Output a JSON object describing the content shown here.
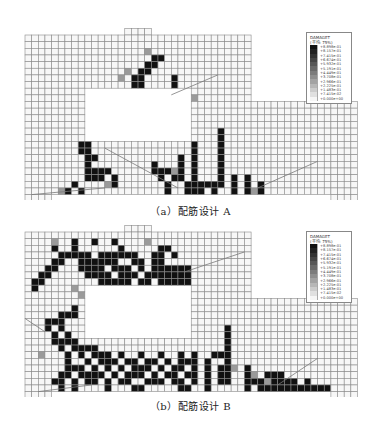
{
  "figure": {
    "cell_size": 6.65,
    "mesh_color": "#8a8a8a",
    "fill_color": "#f7f7f7",
    "damage_color": "#111111",
    "geometry": {
      "upper_cols": 34,
      "total_cols": 50,
      "upper_rows": 10,
      "total_rows": 24,
      "opening": {
        "col0": 9,
        "col1": 25,
        "row0": 8,
        "row1": 16
      },
      "top_stub": {
        "col0": 15,
        "col1": 19
      },
      "bottom_left_stub": {
        "col0": 0,
        "col1": 4
      },
      "bottom_right_stub": {
        "col0": 46,
        "col1": 50
      }
    }
  },
  "legend": {
    "title": "DAMAGET",
    "subtitle": "(平均: 75%)",
    "entries": [
      {
        "value": "+8.898e-01",
        "color": "#111111"
      },
      {
        "value": "+8.157e-01",
        "color": "#222222"
      },
      {
        "value": "+7.415e-01",
        "color": "#333333"
      },
      {
        "value": "+6.674e-01",
        "color": "#454545"
      },
      {
        "value": "+5.932e-01",
        "color": "#575757"
      },
      {
        "value": "+5.191e-01",
        "color": "#6a6a6a"
      },
      {
        "value": "+4.449e-01",
        "color": "#7c7c7c"
      },
      {
        "value": "+3.708e-01",
        "color": "#8f8f8f"
      },
      {
        "value": "+2.966e-01",
        "color": "#a3a3a3"
      },
      {
        "value": "+2.225e-01",
        "color": "#b7b7b7"
      },
      {
        "value": "+1.483e-01",
        "color": "#cccccc"
      },
      {
        "value": "+7.415e-02",
        "color": "#e0e0e0"
      },
      {
        "value": "+0.000e+00",
        "color": "#f6f6f6"
      }
    ]
  },
  "panels": [
    {
      "id": "A",
      "caption": "（a）配筋设计 A",
      "damage": [
        [
          19,
          3
        ],
        [
          20,
          3
        ],
        [
          18,
          4
        ],
        [
          19,
          4
        ],
        [
          17,
          5
        ],
        [
          18,
          5
        ],
        [
          16,
          6
        ],
        [
          17,
          6
        ],
        [
          16,
          7
        ],
        [
          17,
          7
        ],
        [
          22,
          6
        ],
        [
          22,
          7
        ],
        [
          19,
          8
        ],
        [
          21,
          8
        ],
        [
          22,
          8
        ],
        [
          23,
          8
        ],
        [
          24,
          8
        ],
        [
          20,
          9
        ],
        [
          22,
          9
        ],
        [
          24,
          9
        ],
        [
          8,
          16
        ],
        [
          9,
          16
        ],
        [
          8,
          17
        ],
        [
          9,
          17
        ],
        [
          9,
          18
        ],
        [
          10,
          18
        ],
        [
          9,
          19
        ],
        [
          9,
          20
        ],
        [
          10,
          20
        ],
        [
          11,
          20
        ],
        [
          12,
          20
        ],
        [
          9,
          21
        ],
        [
          10,
          21
        ],
        [
          11,
          21
        ],
        [
          13,
          21
        ],
        [
          13,
          22
        ],
        [
          7,
          22
        ],
        [
          6,
          23
        ],
        [
          8,
          23
        ],
        [
          19,
          19
        ],
        [
          19,
          20
        ],
        [
          20,
          20
        ],
        [
          21,
          20
        ],
        [
          20,
          21
        ],
        [
          22,
          21
        ],
        [
          23,
          21
        ],
        [
          21,
          22
        ],
        [
          24,
          22
        ],
        [
          21,
          23
        ],
        [
          24,
          23
        ],
        [
          23,
          18
        ],
        [
          23,
          19
        ],
        [
          23,
          20
        ],
        [
          25,
          16
        ],
        [
          25,
          17
        ],
        [
          25,
          18
        ],
        [
          25,
          19
        ],
        [
          25,
          20
        ],
        [
          25,
          21
        ],
        [
          25,
          22
        ],
        [
          26,
          22
        ],
        [
          26,
          23
        ],
        [
          25,
          23
        ],
        [
          27,
          22
        ],
        [
          29,
          14
        ],
        [
          29,
          15
        ],
        [
          29,
          16
        ],
        [
          29,
          17
        ],
        [
          29,
          18
        ],
        [
          29,
          19
        ],
        [
          29,
          20
        ],
        [
          29,
          21
        ],
        [
          29,
          22
        ],
        [
          28,
          22
        ],
        [
          28,
          23
        ],
        [
          31,
          21
        ],
        [
          31,
          22
        ],
        [
          31,
          23
        ],
        [
          33,
          21
        ],
        [
          33,
          22
        ],
        [
          33,
          23
        ],
        [
          35,
          22
        ],
        [
          35,
          23
        ]
      ],
      "halos": [
        [
          14,
          6
        ],
        [
          15,
          5
        ],
        [
          18,
          2
        ],
        [
          19,
          9
        ],
        [
          25,
          9
        ],
        [
          12,
          22
        ],
        [
          5,
          23
        ],
        [
          22,
          20
        ],
        [
          34,
          23
        ]
      ],
      "lines": [
        [
          [
            12,
            17
          ],
          [
            23,
            23
          ]
        ],
        [
          [
            35,
            23
          ],
          [
            44,
            19
          ]
        ],
        [
          [
            22,
            9
          ],
          [
            29,
            6
          ]
        ],
        [
          [
            1,
            24
          ],
          [
            12,
            23
          ]
        ]
      ]
    },
    {
      "id": "B",
      "caption": "（b）配筋设计 B",
      "damage": [
        [
          4,
          2
        ],
        [
          7,
          1
        ],
        [
          7,
          2
        ],
        [
          10,
          1
        ],
        [
          13,
          1
        ],
        [
          14,
          2
        ],
        [
          20,
          2
        ],
        [
          21,
          2
        ],
        [
          20,
          3
        ],
        [
          22,
          3
        ],
        [
          5,
          3
        ],
        [
          6,
          3
        ],
        [
          7,
          3
        ],
        [
          8,
          3
        ],
        [
          9,
          3
        ],
        [
          11,
          3
        ],
        [
          12,
          3
        ],
        [
          13,
          3
        ],
        [
          14,
          3
        ],
        [
          15,
          3
        ],
        [
          16,
          3
        ],
        [
          19,
          3
        ],
        [
          4,
          4
        ],
        [
          5,
          4
        ],
        [
          8,
          4
        ],
        [
          9,
          4
        ],
        [
          10,
          4
        ],
        [
          11,
          4
        ],
        [
          12,
          4
        ],
        [
          13,
          4
        ],
        [
          16,
          4
        ],
        [
          17,
          4
        ],
        [
          19,
          4
        ],
        [
          20,
          4
        ],
        [
          3,
          5
        ],
        [
          4,
          5
        ],
        [
          8,
          5
        ],
        [
          9,
          5
        ],
        [
          10,
          5
        ],
        [
          11,
          5
        ],
        [
          13,
          5
        ],
        [
          14,
          5
        ],
        [
          15,
          5
        ],
        [
          17,
          5
        ],
        [
          19,
          5
        ],
        [
          20,
          5
        ],
        [
          21,
          5
        ],
        [
          22,
          5
        ],
        [
          23,
          5
        ],
        [
          24,
          5
        ],
        [
          2,
          6
        ],
        [
          3,
          6
        ],
        [
          9,
          6
        ],
        [
          10,
          6
        ],
        [
          11,
          6
        ],
        [
          12,
          6
        ],
        [
          14,
          6
        ],
        [
          15,
          6
        ],
        [
          16,
          6
        ],
        [
          18,
          6
        ],
        [
          19,
          6
        ],
        [
          20,
          6
        ],
        [
          21,
          6
        ],
        [
          22,
          6
        ],
        [
          23,
          6
        ],
        [
          24,
          6
        ],
        [
          1,
          7
        ],
        [
          2,
          7
        ],
        [
          11,
          7
        ],
        [
          12,
          7
        ],
        [
          13,
          7
        ],
        [
          14,
          7
        ],
        [
          15,
          7
        ],
        [
          17,
          7
        ],
        [
          18,
          7
        ],
        [
          20,
          7
        ],
        [
          21,
          7
        ],
        [
          22,
          7
        ],
        [
          23,
          7
        ],
        [
          24,
          7
        ],
        [
          1,
          8
        ],
        [
          12,
          8
        ],
        [
          13,
          8
        ],
        [
          14,
          8
        ],
        [
          16,
          8
        ],
        [
          18,
          8
        ],
        [
          19,
          8
        ],
        [
          7,
          11
        ],
        [
          5,
          12
        ],
        [
          6,
          12
        ],
        [
          7,
          12
        ],
        [
          3,
          13
        ],
        [
          4,
          13
        ],
        [
          5,
          13
        ],
        [
          3,
          14
        ],
        [
          5,
          14
        ],
        [
          4,
          15
        ],
        [
          6,
          15
        ],
        [
          4,
          16
        ],
        [
          5,
          16
        ],
        [
          6,
          16
        ],
        [
          7,
          16
        ],
        [
          5,
          17
        ],
        [
          7,
          17
        ],
        [
          8,
          17
        ],
        [
          9,
          17
        ],
        [
          10,
          17
        ],
        [
          6,
          18
        ],
        [
          8,
          18
        ],
        [
          10,
          18
        ],
        [
          11,
          18
        ],
        [
          12,
          18
        ],
        [
          14,
          18
        ],
        [
          17,
          18
        ],
        [
          20,
          18
        ],
        [
          23,
          18
        ],
        [
          25,
          18
        ],
        [
          6,
          19
        ],
        [
          9,
          19
        ],
        [
          11,
          19
        ],
        [
          12,
          19
        ],
        [
          13,
          19
        ],
        [
          15,
          19
        ],
        [
          16,
          19
        ],
        [
          18,
          19
        ],
        [
          19,
          19
        ],
        [
          21,
          19
        ],
        [
          23,
          19
        ],
        [
          24,
          19
        ],
        [
          25,
          19
        ],
        [
          6,
          20
        ],
        [
          7,
          20
        ],
        [
          8,
          20
        ],
        [
          10,
          20
        ],
        [
          12,
          20
        ],
        [
          14,
          20
        ],
        [
          16,
          20
        ],
        [
          17,
          20
        ],
        [
          18,
          20
        ],
        [
          20,
          20
        ],
        [
          22,
          20
        ],
        [
          23,
          20
        ],
        [
          25,
          20
        ],
        [
          5,
          21
        ],
        [
          6,
          21
        ],
        [
          8,
          21
        ],
        [
          9,
          21
        ],
        [
          10,
          21
        ],
        [
          11,
          21
        ],
        [
          13,
          21
        ],
        [
          15,
          21
        ],
        [
          16,
          21
        ],
        [
          17,
          21
        ],
        [
          19,
          21
        ],
        [
          21,
          21
        ],
        [
          22,
          21
        ],
        [
          24,
          21
        ],
        [
          25,
          21
        ],
        [
          4,
          22
        ],
        [
          5,
          22
        ],
        [
          7,
          22
        ],
        [
          9,
          22
        ],
        [
          10,
          22
        ],
        [
          12,
          22
        ],
        [
          14,
          22
        ],
        [
          15,
          22
        ],
        [
          18,
          22
        ],
        [
          19,
          22
        ],
        [
          20,
          22
        ],
        [
          22,
          22
        ],
        [
          23,
          22
        ],
        [
          25,
          22
        ],
        [
          5,
          23
        ],
        [
          7,
          23
        ],
        [
          12,
          23
        ],
        [
          16,
          23
        ],
        [
          17,
          23
        ],
        [
          23,
          23
        ],
        [
          24,
          23
        ],
        [
          30,
          14
        ],
        [
          30,
          15
        ],
        [
          30,
          16
        ],
        [
          30,
          17
        ],
        [
          30,
          18
        ],
        [
          30,
          19
        ],
        [
          30,
          20
        ],
        [
          30,
          21
        ],
        [
          30,
          22
        ],
        [
          28,
          18
        ],
        [
          29,
          18
        ],
        [
          27,
          19
        ],
        [
          27,
          20
        ],
        [
          27,
          21
        ],
        [
          27,
          22
        ],
        [
          27,
          23
        ],
        [
          29,
          20
        ],
        [
          29,
          21
        ],
        [
          29,
          22
        ],
        [
          33,
          20
        ],
        [
          33,
          21
        ],
        [
          33,
          22
        ],
        [
          33,
          23
        ],
        [
          34,
          22
        ],
        [
          35,
          22
        ],
        [
          35,
          23
        ],
        [
          36,
          21
        ],
        [
          37,
          21
        ],
        [
          37,
          22
        ],
        [
          38,
          21
        ],
        [
          38,
          22
        ],
        [
          39,
          22
        ],
        [
          40,
          22
        ],
        [
          40,
          23
        ],
        [
          36,
          23
        ],
        [
          37,
          23
        ],
        [
          38,
          23
        ],
        [
          39,
          23
        ],
        [
          41,
          23
        ],
        [
          42,
          23
        ],
        [
          43,
          23
        ],
        [
          44,
          23
        ],
        [
          45,
          23
        ],
        [
          42,
          22
        ]
      ],
      "halos": [
        [
          4,
          1
        ],
        [
          18,
          1
        ],
        [
          21,
          6
        ],
        [
          22,
          7
        ],
        [
          7,
          8
        ],
        [
          8,
          9
        ],
        [
          3,
          14
        ],
        [
          2,
          18
        ],
        [
          12,
          19
        ],
        [
          14,
          20
        ],
        [
          24,
          14
        ],
        [
          31,
          20
        ],
        [
          34,
          21
        ],
        [
          36,
          22
        ]
      ],
      "lines": [
        [
          [
            24,
            6
          ],
          [
            33,
            3
          ]
        ],
        [
          [
            0,
            13
          ],
          [
            3,
            15
          ]
        ],
        [
          [
            38,
            23
          ],
          [
            44,
            19
          ]
        ],
        [
          [
            2,
            24
          ],
          [
            10,
            23
          ]
        ]
      ]
    }
  ]
}
